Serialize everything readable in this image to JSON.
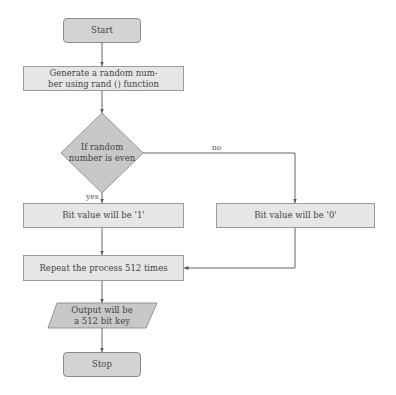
{
  "diagram": {
    "type": "flowchart",
    "nodes": {
      "start": {
        "label": "Start",
        "shape": "rounded-rect"
      },
      "generate": {
        "label": "Generate a random num-ber using rand () function",
        "line1": "Generate a random num-",
        "line2": "ber using rand () function",
        "shape": "rect"
      },
      "decision": {
        "line1": "If random",
        "line2": "number is even",
        "shape": "diamond"
      },
      "bit1": {
        "label": "Bit value will be '1'",
        "shape": "rect"
      },
      "bit0": {
        "label": "Bit value will be '0'",
        "shape": "rect"
      },
      "repeat": {
        "label": "Repeat the process 512 times",
        "shape": "rect"
      },
      "output": {
        "line1": "Output will be",
        "line2": "a 512 bit key",
        "shape": "parallelogram"
      },
      "stop": {
        "label": "Stop",
        "shape": "rounded-rect"
      }
    },
    "edges": [
      {
        "from": "start",
        "to": "generate",
        "label": ""
      },
      {
        "from": "generate",
        "to": "decision",
        "label": ""
      },
      {
        "from": "decision",
        "to": "bit1",
        "label": "yes"
      },
      {
        "from": "decision",
        "to": "bit0",
        "label": "no"
      },
      {
        "from": "bit1",
        "to": "repeat",
        "label": ""
      },
      {
        "from": "bit0",
        "to": "repeat",
        "label": ""
      },
      {
        "from": "repeat",
        "to": "output",
        "label": ""
      },
      {
        "from": "output",
        "to": "stop",
        "label": ""
      }
    ],
    "edge_labels": {
      "yes": "yes",
      "no": "no"
    },
    "colors": {
      "terminal_fill": "#d3d3d3",
      "process_fill": "#e6e6e6",
      "decision_fill": "#c8c8c8",
      "stroke": "#8a8a8a",
      "line": "#555555"
    }
  }
}
